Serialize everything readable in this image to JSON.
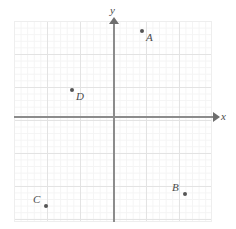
{
  "figure": {
    "kind": "coordinate-plane",
    "background_color": "#ffffff",
    "grid": {
      "minor_color": "#f4f4f4",
      "major_color": "#e3e3e3",
      "minor_cell_px": 6.6,
      "major_every_n_cells": 5,
      "visible": true
    },
    "axes": {
      "color": "#8c8c8c",
      "arrow_color": "#6e6e6e",
      "x_label": "x",
      "y_label": "y",
      "origin_px": {
        "x": 114,
        "y": 117
      },
      "tick_labels": [],
      "numbers_shown": false
    },
    "point_color": "#555555",
    "label_color": "#4a4a4a"
  },
  "chart_data": {
    "type": "scatter",
    "title": "",
    "xlabel": "x",
    "ylabel": "y",
    "grid": true,
    "legend": "none",
    "units_per_minor_cell": 1,
    "minor_cells_per_major": 5,
    "xlim": [
      -15,
      15
    ],
    "ylim": [
      -16,
      15
    ],
    "tick_labels_x": [],
    "tick_labels_y": [],
    "points": [
      {
        "label": "A",
        "x": 4,
        "y": 13,
        "quadrant": "I",
        "px": {
          "x": 142,
          "y": 31
        },
        "label_position": "bottom-right"
      },
      {
        "label": "D",
        "x": -6,
        "y": 4,
        "quadrant": "II",
        "px": {
          "x": 72,
          "y": 90
        },
        "label_position": "bottom-right"
      },
      {
        "label": "C",
        "x": -10,
        "y": -13,
        "quadrant": "III",
        "px": {
          "x": 46,
          "y": 206
        },
        "label_position": "top-left"
      },
      {
        "label": "B",
        "x": 11,
        "y": -12,
        "quadrant": "IV",
        "px": {
          "x": 185,
          "y": 194
        },
        "label_position": "top-left"
      }
    ]
  }
}
